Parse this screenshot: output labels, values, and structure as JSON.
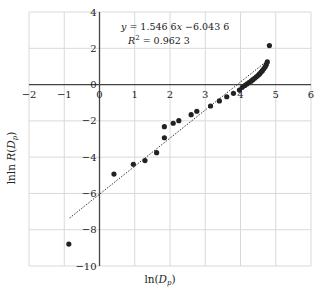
{
  "chart_data": {
    "type": "scatter",
    "title": "",
    "xlabel": "ln(D_p)",
    "ylabel": "lnln R(D_p)",
    "xlim": [
      -2,
      6
    ],
    "ylim": [
      -10,
      4
    ],
    "x_ticks": [
      -2,
      -1,
      0,
      1,
      2,
      3,
      4,
      5,
      6
    ],
    "y_ticks": [
      4,
      2,
      0,
      -2,
      -4,
      -6,
      -8,
      -10
    ],
    "grid": true,
    "legend": "none",
    "series": [
      {
        "name": "data",
        "marker": "circle",
        "color": "#222222",
        "points": [
          [
            -0.87,
            -8.79
          ],
          [
            0.41,
            -4.93
          ],
          [
            0.96,
            -4.39
          ],
          [
            1.29,
            -4.19
          ],
          [
            1.62,
            -3.75
          ],
          [
            1.84,
            -2.93
          ],
          [
            1.84,
            -2.32
          ],
          [
            2.09,
            -2.13
          ],
          [
            2.25,
            -1.99
          ],
          [
            2.6,
            -1.66
          ],
          [
            2.76,
            -1.47
          ],
          [
            3.15,
            -1.18
          ],
          [
            3.4,
            -0.9
          ],
          [
            3.61,
            -0.67
          ],
          [
            3.8,
            -0.48
          ],
          [
            3.97,
            -0.3
          ],
          [
            4.05,
            -0.15
          ],
          [
            4.12,
            -0.05
          ],
          [
            4.18,
            0.03
          ],
          [
            4.24,
            0.11
          ],
          [
            4.3,
            0.19
          ],
          [
            4.35,
            0.27
          ],
          [
            4.4,
            0.35
          ],
          [
            4.45,
            0.43
          ],
          [
            4.5,
            0.51
          ],
          [
            4.54,
            0.59
          ],
          [
            4.58,
            0.68
          ],
          [
            4.62,
            0.77
          ],
          [
            4.66,
            0.87
          ],
          [
            4.7,
            0.98
          ],
          [
            4.73,
            1.1
          ],
          [
            4.76,
            1.25
          ],
          [
            4.82,
            2.15
          ]
        ]
      },
      {
        "name": "linear fit",
        "type": "line",
        "style": "dotted",
        "color": "#333333",
        "slope": 1.5466,
        "intercept": -6.0436,
        "x_range": [
          -0.85,
          4.8
        ]
      }
    ],
    "annotations": [
      {
        "text": "y = 1.546 6x −6.043 6",
        "x": 0.1,
        "y": 3.5
      },
      {
        "text": "R² = 0.962 3",
        "x": 0.6,
        "y": 2.6
      }
    ]
  },
  "labels": {
    "xlabel_main": "ln(",
    "xlabel_var": "D",
    "xlabel_sub": "p",
    "xlabel_end": ")",
    "ylabel_main": "lnln ",
    "ylabel_var": "R",
    "ylabel_open": "(",
    "ylabel_var2": "D",
    "ylabel_sub": "p",
    "ylabel_end": ")",
    "eq_line1": "y = 1.546 6x −6.043 6",
    "eq_line2_pre": "R",
    "eq_line2_sup": "2",
    "eq_line2_post": " = 0.962 3"
  }
}
